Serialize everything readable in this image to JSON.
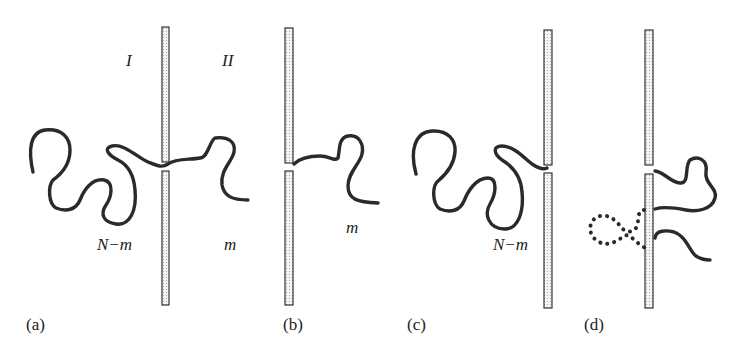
{
  "figure": {
    "panels": [
      {
        "id": "a",
        "label": "(a)",
        "regions": {
          "left": "I",
          "right": "II"
        },
        "segment_labels": {
          "left": "N−m",
          "right": "m"
        },
        "description": "Polymer chain threading through pore in membrane; N−m segments on side I, m segments on side II"
      },
      {
        "id": "b",
        "label": "(b)",
        "segment_labels": {
          "right": "m"
        },
        "description": "Only the m-segment portion on the trans side"
      },
      {
        "id": "c",
        "label": "(c)",
        "segment_labels": {
          "left": "N−m"
        },
        "description": "Only the N−m segment portion on the cis side"
      },
      {
        "id": "d",
        "label": "(d)",
        "description": "Chain portions adjacent to wall; dotted loop on left, two solid strands on right"
      }
    ],
    "colors": {
      "chain": "#2a2a2a",
      "wall_border": "#333333",
      "wall_fill": "#f2f2f2",
      "background": "#ffffff"
    }
  }
}
